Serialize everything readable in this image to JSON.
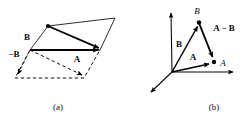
{
  "figure": {
    "title_present": false,
    "background_color": "#ffffff",
    "ink_color": "#0a0a0a",
    "panels": [
      {
        "id": "panel-a",
        "caption": "(a)",
        "caption_pos": {
          "x": 58,
          "y": 108
        },
        "description": "Parallelogram construction of vector subtraction",
        "labels": [
          {
            "name": "label-B",
            "text": "B",
            "style": "bold",
            "x": 30,
            "y": 38
          },
          {
            "name": "label-minus-B",
            "text": "−B",
            "style": "bold",
            "x": 8,
            "y": 54
          },
          {
            "name": "label-A",
            "text": "A",
            "style": "bold",
            "x": 77,
            "y": 60
          }
        ],
        "polygon_upper": [
          {
            "x": 30,
            "y": 50
          },
          {
            "x": 48,
            "y": 26
          },
          {
            "x": 115,
            "y": 18
          },
          {
            "x": 100,
            "y": 50
          }
        ],
        "polygon_lower": [
          {
            "x": 30,
            "y": 50
          },
          {
            "x": 100,
            "y": 50
          },
          {
            "x": 84,
            "y": 78
          },
          {
            "x": 15,
            "y": 78
          }
        ],
        "vectors": [
          {
            "name": "vector-A",
            "from": {
              "x": 30,
              "y": 50
            },
            "to": {
              "x": 101,
              "y": 50
            },
            "stroke": "solid",
            "arrow": true
          },
          {
            "name": "vector-B-to-A-diagonal",
            "from": {
              "x": 48,
              "y": 26
            },
            "to": {
              "x": 101,
              "y": 49
            },
            "stroke": "solid",
            "arrow": true
          },
          {
            "name": "vector-minus-B",
            "from": {
              "x": 30,
              "y": 50
            },
            "to": {
              "x": 16,
              "y": 78
            },
            "stroke": "dashed",
            "arrow": true
          },
          {
            "name": "vector-A-minus-B",
            "from": {
              "x": 30,
              "y": 50
            },
            "to": {
              "x": 85,
              "y": 77
            },
            "stroke": "dashed",
            "arrow": true
          }
        ]
      },
      {
        "id": "panel-b",
        "caption": "(b)",
        "caption_pos": {
          "x": 214,
          "y": 108
        },
        "description": "Three-axis coordinate frame with vectors A, B and A minus B",
        "origin": {
          "x": 172,
          "y": 72
        },
        "axes": [
          {
            "name": "axis-vertical",
            "to": {
              "x": 171,
              "y": 9
            }
          },
          {
            "name": "axis-horizontal",
            "to": {
              "x": 238,
              "y": 72
            }
          },
          {
            "name": "axis-diagonal",
            "to": {
              "x": 147,
              "y": 96
            }
          }
        ],
        "points": [
          {
            "name": "point-B",
            "x": 199,
            "y": 22,
            "label": "B",
            "label_x": 197,
            "label_y": 14,
            "style": "italic"
          },
          {
            "name": "point-A",
            "x": 214,
            "y": 62,
            "label": "A",
            "label_x": 221,
            "label_y": 66,
            "style": "italic"
          }
        ],
        "labels": [
          {
            "name": "label-B",
            "text": "B",
            "style": "bold",
            "x": 179,
            "y": 44
          },
          {
            "name": "label-A",
            "text": "A",
            "style": "bold",
            "x": 193,
            "y": 58
          },
          {
            "name": "label-A-minus-B",
            "text": "A − B",
            "style": "bold",
            "x": 211,
            "y": 30
          }
        ],
        "vectors": [
          {
            "name": "vector-B",
            "from": {
              "x": 172,
              "y": 72
            },
            "to": {
              "x": 199,
              "y": 23
            },
            "arrow": true
          },
          {
            "name": "vector-A",
            "from": {
              "x": 172,
              "y": 72
            },
            "to": {
              "x": 214,
              "y": 63
            },
            "arrow": true
          },
          {
            "name": "vector-A-minus-B",
            "from": {
              "x": 199,
              "y": 23
            },
            "to": {
              "x": 214,
              "y": 61
            },
            "arrow": true
          }
        ]
      }
    ]
  }
}
